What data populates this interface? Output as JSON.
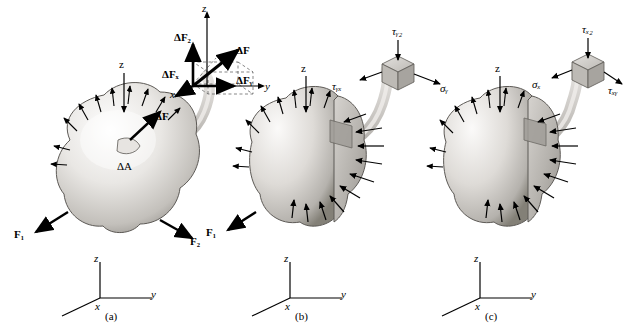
{
  "figure": {
    "panels": [
      {
        "id": "a",
        "caption": "(a)",
        "axis_labels": {
          "x": "x",
          "y": "y",
          "z": "z"
        },
        "body_axis_z": "z",
        "labels": [
          {
            "name": "delta-F",
            "text": "ΔF"
          },
          {
            "name": "delta-A",
            "text": "ΔA"
          },
          {
            "name": "force-F1",
            "text": "F₁"
          },
          {
            "name": "force-F2",
            "text": "F₂"
          }
        ],
        "inset": {
          "axis_labels": {
            "x": "x",
            "y": "y",
            "z": "z"
          },
          "components": [
            {
              "name": "delta-Fz",
              "text": "ΔF₂"
            },
            {
              "name": "delta-F",
              "text": "ΔF"
            },
            {
              "name": "delta-Fx",
              "text": "ΔFₓ"
            },
            {
              "name": "delta-Fy",
              "text": "ΔFᵧ"
            }
          ]
        }
      },
      {
        "id": "b",
        "caption": "(b)",
        "axis_labels": {
          "x": "x",
          "y": "y",
          "z": "z"
        },
        "body_axis_z": "z",
        "labels": [
          {
            "name": "force-F1",
            "text": "F₁"
          }
        ],
        "inset": {
          "components": [
            {
              "name": "tau-yz",
              "text": "τᵧ₂"
            },
            {
              "name": "tau-yx",
              "text": "τᵧₓ"
            },
            {
              "name": "sigma-y",
              "text": "σᵧ"
            }
          ]
        }
      },
      {
        "id": "c",
        "caption": "(c)",
        "axis_labels": {
          "x": "x",
          "y": "y",
          "z": "z"
        },
        "body_axis_z": "z",
        "labels": [],
        "inset": {
          "components": [
            {
              "name": "tau-xz",
              "text": "τₓ₂"
            },
            {
              "name": "sigma-x",
              "text": "σₓ"
            },
            {
              "name": "tau-xy",
              "text": "τₓᵧ"
            }
          ]
        }
      }
    ],
    "colors": {
      "body_light": "#f2f0ee",
      "body_mid": "#cdcac6",
      "body_dark": "#8f8c88",
      "section_face": "#b9b6b2",
      "stroke": "#000000",
      "tube": "#cfccc8"
    }
  }
}
